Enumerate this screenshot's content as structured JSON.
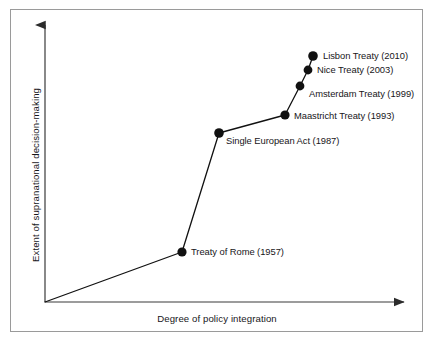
{
  "chart_data": {
    "type": "line",
    "title": "",
    "subtitle": "",
    "xlabel": "Degree of policy integration",
    "ylabel": "Extent of supranational decision-making",
    "xlim": [
      0,
      100
    ],
    "ylim": [
      0,
      100
    ],
    "grid": false,
    "legend": "none",
    "axis_style": "arrow-headed open axes, no tick marks, no tick labels",
    "series": [
      {
        "name": "European integration treaties",
        "marker": "filled-circle",
        "color": "#111111",
        "points": [
          {
            "label": "Treaty of Rome (1957)",
            "year": 1957,
            "x": 37.6,
            "y": 17.9,
            "px": 182,
            "py": 252
          },
          {
            "label": "Single European Act (1987)",
            "year": 1987,
            "x": 47.8,
            "y": 60.4,
            "px": 219,
            "py": 133
          },
          {
            "label": "Maastricht Treaty (1993)",
            "year": 1993,
            "x": 65.9,
            "y": 66.8,
            "px": 285,
            "py": 115
          },
          {
            "label": "Amsterdam Treaty (1999)",
            "year": 1999,
            "x": 70.1,
            "y": 77.1,
            "px": 300,
            "py": 86
          },
          {
            "label": "Nice Treaty (2003)",
            "year": 2003,
            "x": 72.3,
            "y": 82.9,
            "px": 308,
            "py": 70
          },
          {
            "label": "Lisbon Treaty (2010)",
            "year": 2010,
            "x": 73.6,
            "y": 87.9,
            "px": 313,
            "py": 56
          }
        ]
      }
    ],
    "origin": {
      "px": 45,
      "py": 302
    },
    "colors": {
      "line": "#111111",
      "marker": "#111111",
      "axis": "#3a3a3a",
      "frame": "#9a9a9a",
      "text": "#17161a",
      "background": "#ffffff"
    }
  }
}
